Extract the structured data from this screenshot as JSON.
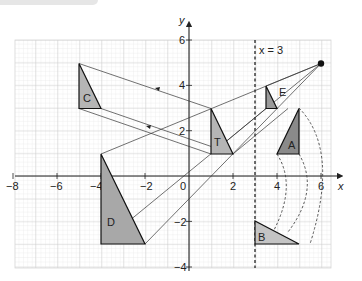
{
  "figure": {
    "title": "",
    "axes": {
      "x_label": "x",
      "y_label": "y",
      "x_range": [
        -8,
        6
      ],
      "y_range": [
        -4,
        6
      ],
      "x_ticks": [
        "−8",
        "−6",
        "−4",
        "−2",
        "0",
        "2",
        "4",
        "6"
      ],
      "y_ticks": [
        "6",
        "4",
        "2",
        "−2",
        "−4"
      ],
      "origin_label": "0",
      "grid": true
    },
    "mirror_line": {
      "label": "x = 3",
      "x": 3,
      "style": "dashed"
    },
    "centre_of_enlargement": {
      "x": 6,
      "y": 5
    },
    "shapes": [
      {
        "label": "T",
        "points": [
          [
            1,
            3
          ],
          [
            1,
            1
          ],
          [
            2,
            1
          ]
        ],
        "fill": "#b5b5b5"
      },
      {
        "label": "C",
        "points": [
          [
            -5,
            5
          ],
          [
            -5,
            3
          ],
          [
            -4,
            3
          ]
        ],
        "fill": "#b5b5b5"
      },
      {
        "label": "D",
        "points": [
          [
            -4,
            1
          ],
          [
            -4,
            -3
          ],
          [
            -2,
            -3
          ]
        ],
        "fill": "#a8a8a8"
      },
      {
        "label": "E",
        "points": [
          [
            3.5,
            4
          ],
          [
            3.5,
            3
          ],
          [
            4,
            3
          ]
        ],
        "fill": "#999999"
      },
      {
        "label": "A",
        "points": [
          [
            5,
            3
          ],
          [
            4,
            1
          ],
          [
            5,
            1
          ]
        ],
        "fill": "#8a8a8a"
      },
      {
        "label": "B",
        "points": [
          [
            3.5,
            -2
          ],
          [
            3.5,
            -3
          ],
          [
            5.5,
            -3
          ]
        ],
        "fill": "#c4c4c4"
      }
    ],
    "colors": {
      "grid_minor": "#e2e2e2",
      "grid_major": "#c8c8c8",
      "axis": "#222222",
      "line": "#333333"
    }
  }
}
